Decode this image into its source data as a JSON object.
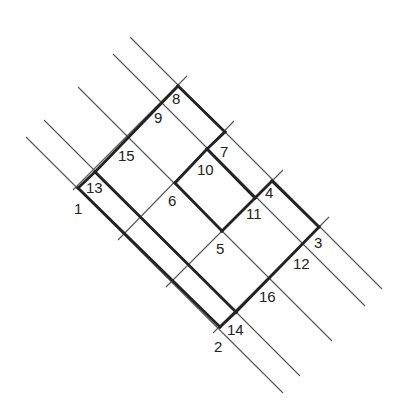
{
  "diagram": {
    "colors": {
      "thin_line": "#555555",
      "thick_line": "#222222",
      "label": "#222222",
      "background": "#ffffff"
    },
    "thin_lines": [
      {
        "id": "L_a",
        "x1": 26,
        "y1": 137,
        "x2": 283,
        "y2": 393
      },
      {
        "id": "L_b",
        "x1": 44,
        "y1": 120,
        "x2": 300,
        "y2": 376
      },
      {
        "id": "L_c",
        "x1": 78,
        "y1": 87,
        "x2": 332,
        "y2": 341
      },
      {
        "id": "L_d",
        "x1": 113,
        "y1": 54,
        "x2": 365,
        "y2": 306
      },
      {
        "id": "L_e",
        "x1": 130,
        "y1": 37,
        "x2": 382,
        "y2": 289
      },
      {
        "id": "M_1",
        "x1": 187,
        "y1": 76,
        "x2": 73,
        "y2": 190
      },
      {
        "id": "M_2",
        "x1": 234,
        "y1": 121,
        "x2": 118,
        "y2": 240
      },
      {
        "id": "M_3",
        "x1": 283,
        "y1": 170,
        "x2": 166,
        "y2": 287
      },
      {
        "id": "M_4",
        "x1": 329,
        "y1": 217,
        "x2": 213,
        "y2": 333
      }
    ],
    "thick_segments": [
      {
        "from": "8",
        "to": "13"
      },
      {
        "from": "13",
        "to": "1"
      },
      {
        "from": "8",
        "to": "7"
      },
      {
        "from": "7",
        "to": "10"
      },
      {
        "from": "10",
        "to": "11"
      },
      {
        "from": "11",
        "to": "4"
      },
      {
        "from": "4",
        "to": "3"
      },
      {
        "from": "3",
        "to": "14"
      },
      {
        "from": "14",
        "to": "2"
      },
      {
        "from": "13",
        "to": "14"
      },
      {
        "from": "1",
        "to": "2"
      },
      {
        "from": "10",
        "to": "6"
      },
      {
        "from": "6",
        "to": "5"
      },
      {
        "from": "5",
        "to": "11"
      }
    ],
    "points": [
      {
        "label": "1",
        "x": 78,
        "y": 188,
        "lx": 74,
        "ly": 214
      },
      {
        "label": "2",
        "x": 220,
        "y": 327,
        "lx": 214,
        "ly": 352
      },
      {
        "label": "3",
        "x": 319,
        "y": 227,
        "lx": 314,
        "ly": 248
      },
      {
        "label": "4",
        "x": 272,
        "y": 181,
        "lx": 265,
        "ly": 198
      },
      {
        "label": "5",
        "x": 222,
        "y": 231,
        "lx": 216,
        "ly": 254
      },
      {
        "label": "6",
        "x": 175,
        "y": 183,
        "lx": 168,
        "ly": 206
      },
      {
        "label": "7",
        "x": 225,
        "y": 132,
        "lx": 220,
        "ly": 157
      },
      {
        "label": "8",
        "x": 178,
        "y": 86,
        "lx": 172,
        "ly": 104
      },
      {
        "label": "9",
        "x": 162,
        "y": 103,
        "lx": 154,
        "ly": 123
      },
      {
        "label": "10",
        "x": 207,
        "y": 149,
        "lx": 197,
        "ly": 175
      },
      {
        "label": "11",
        "x": 255,
        "y": 198,
        "lx": 246,
        "ly": 219
      },
      {
        "label": "12",
        "x": 302,
        "y": 243,
        "lx": 293,
        "ly": 269
      },
      {
        "label": "13",
        "x": 95,
        "y": 172,
        "lx": 86,
        "ly": 193
      },
      {
        "label": "14",
        "x": 236,
        "y": 312,
        "lx": 227,
        "ly": 335
      },
      {
        "label": "15",
        "x": 128,
        "y": 137,
        "lx": 118,
        "ly": 161
      },
      {
        "label": "16",
        "x": 269,
        "y": 278,
        "lx": 259,
        "ly": 302
      }
    ]
  }
}
